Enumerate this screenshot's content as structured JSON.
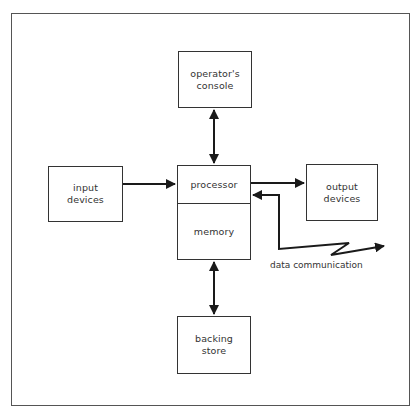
{
  "diagram": {
    "type": "block-diagram",
    "nodes": [
      {
        "id": "console",
        "label": "operator's\nconsole"
      },
      {
        "id": "input",
        "label": "input\ndevices"
      },
      {
        "id": "processor",
        "label": "processor"
      },
      {
        "id": "memory",
        "label": "memory"
      },
      {
        "id": "output",
        "label": "output\ndevices"
      },
      {
        "id": "backing",
        "label": "backing\nstore"
      }
    ],
    "edges": [
      {
        "from": "console",
        "to": "processor",
        "direction": "bidirectional"
      },
      {
        "from": "input",
        "to": "processor",
        "direction": "forward"
      },
      {
        "from": "processor",
        "to": "output",
        "direction": "forward"
      },
      {
        "from": "memory",
        "to": "backing",
        "direction": "bidirectional"
      },
      {
        "from": "processor",
        "to": "data communication",
        "direction": "bidirectional",
        "style": "zigzag"
      }
    ],
    "annotations": {
      "data_communication": "data communication"
    },
    "colors": {
      "line": "#1a1a1a",
      "box_border": "#333333",
      "frame": "#555555",
      "background": "#ffffff"
    }
  }
}
